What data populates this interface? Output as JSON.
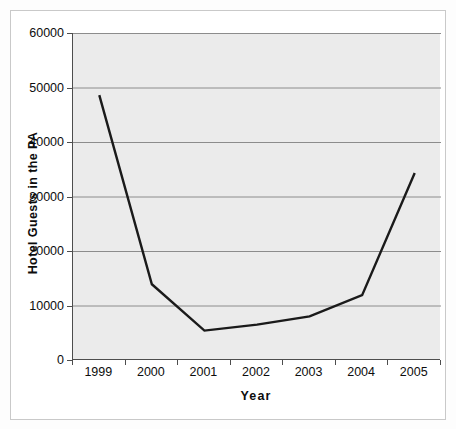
{
  "chart_data": {
    "type": "line",
    "title": "",
    "subtitle": "",
    "xlabel": "Year",
    "ylabel": "Hotel Guests in the PA",
    "categories": [
      "1999",
      "2000",
      "2001",
      "2002",
      "2003",
      "2004",
      "2005"
    ],
    "values": [
      48600,
      13900,
      5400,
      6500,
      8000,
      11900,
      34300
    ],
    "series": [
      {
        "name": "Hotel Guests in the PA",
        "values": [
          48600,
          13900,
          5400,
          6500,
          8000,
          11900,
          34300
        ],
        "color": "#1a1a1a"
      }
    ],
    "ylim": [
      0,
      60000
    ],
    "yticks": [
      0,
      10000,
      20000,
      30000,
      40000,
      50000,
      60000
    ],
    "ytick_labels": [
      "0",
      "10000",
      "20000",
      "30000",
      "40000",
      "50000",
      "60000"
    ],
    "xtick_labels": [
      "1999",
      "2000",
      "2001",
      "2002",
      "2003",
      "2004",
      "2005"
    ],
    "grid": true,
    "grid_axis": "y",
    "legend": false,
    "legend_position": "none",
    "markers": false,
    "plot_background": "#ebebeb",
    "figure_background": "#ffffff",
    "gridline_color": "#8c8c8c",
    "axis_color": "#4d4d4d",
    "line_color": "#1a1a1a"
  }
}
